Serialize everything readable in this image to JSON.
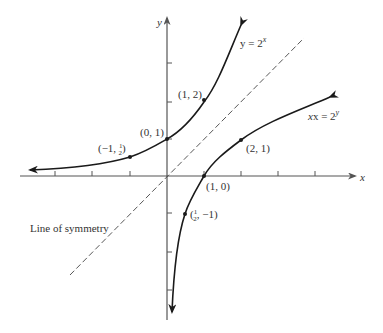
{
  "diagram": {
    "title": "",
    "axes": {
      "x_label": "x",
      "y_label": "y",
      "x_ticks": [
        -4,
        -3,
        -2,
        -1,
        1,
        2,
        3,
        4
      ],
      "y_ticks_positive": [
        1,
        2,
        3
      ],
      "y_ticks_negative": [
        -1,
        -2,
        -3
      ]
    },
    "curves": [
      {
        "name": "exponential",
        "label_base": "y = 2",
        "label_exp": "x",
        "equation": "y = 2^x"
      },
      {
        "name": "logarithmic",
        "label_base": "x = 2",
        "label_exp": "y",
        "equation": "x = 2^y"
      }
    ],
    "symmetry_line": {
      "label": "Line of symmetry",
      "equation": "y = x"
    },
    "points": [
      {
        "coords": [
          1,
          2
        ],
        "label": "(1, 2)"
      },
      {
        "coords": [
          0,
          1
        ],
        "label": "(0, 1)"
      },
      {
        "coords": [
          -1,
          0.5
        ],
        "label_pre": "(−1, ",
        "label_num": "1",
        "label_den": "2",
        "label_post": ")"
      },
      {
        "coords": [
          2,
          1
        ],
        "label": "(2, 1)"
      },
      {
        "coords": [
          1,
          0
        ],
        "label": "(1, 0)"
      },
      {
        "coords": [
          0.5,
          -1
        ],
        "label_pre": "(",
        "label_num": "1",
        "label_den": "2",
        "label_post": ", −1)"
      }
    ],
    "colors": {
      "curve": "#1a1a1a",
      "axis": "#555555",
      "dashed": "#444444",
      "text": "#333333"
    }
  }
}
